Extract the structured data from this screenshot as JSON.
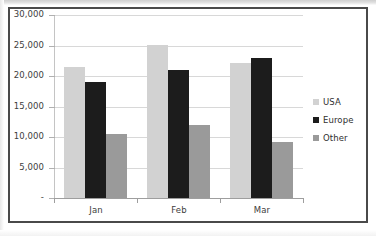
{
  "chart_data": {
    "type": "bar",
    "title": "",
    "subtitle": "",
    "xlabel": "",
    "ylabel": "",
    "categories": [
      "Jan",
      "Feb",
      "Mar"
    ],
    "series": [
      {
        "name": "USA",
        "color": "#d2d2d2",
        "values": [
          21400,
          25000,
          22200
        ]
      },
      {
        "name": "Europe",
        "color": "#1c1c1c",
        "values": [
          19000,
          21000,
          23000
        ]
      },
      {
        "name": "Other",
        "color": "#9a9a9a",
        "values": [
          10500,
          12000,
          9200
        ]
      }
    ],
    "ylim": [
      0,
      30000
    ],
    "ytick_values": [
      0,
      5000,
      10000,
      15000,
      20000,
      25000,
      30000
    ],
    "ytick_labels": [
      "-",
      "5,000",
      "10,000",
      "15,000",
      "20,000",
      "25,000",
      "30,000"
    ],
    "grid": true,
    "legend_position": "right",
    "frame_color": "#4a4a4a",
    "gridline_color": "#d8d8d8",
    "axis_color": "#9e9e9e",
    "text_color": "#3d3d3d"
  },
  "legend": {
    "items": [
      {
        "label": "USA",
        "swatch": "legend-swatch-usa"
      },
      {
        "label": "Europe",
        "swatch": "legend-swatch-europe"
      },
      {
        "label": "Other",
        "swatch": "legend-swatch-other"
      }
    ]
  },
  "y_axis": {
    "labels": [
      "30,000",
      "25,000",
      "20,000",
      "15,000",
      "10,000",
      "5,000",
      "-"
    ]
  },
  "x_axis": {
    "labels": [
      "Jan",
      "Feb",
      "Mar"
    ]
  }
}
